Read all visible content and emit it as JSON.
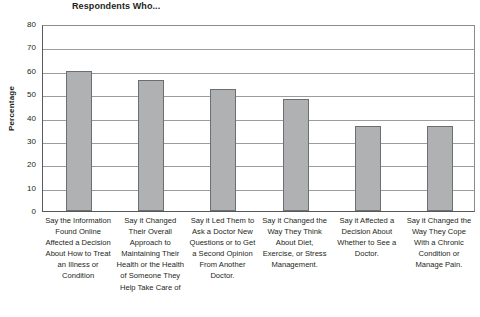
{
  "chart_data": {
    "type": "bar",
    "title": "Respondents Who...",
    "xlabel": "",
    "ylabel": "Percentage",
    "ylim": [
      0,
      80
    ],
    "yticks": [
      0,
      10,
      20,
      30,
      40,
      50,
      60,
      70,
      80
    ],
    "grid": "horizontal",
    "legend": "none",
    "bar_color": "#b0b1b3",
    "bar_border_color": "#6d6e70",
    "categories": [
      "Say the Information Found Online Affected a Decision About How to Treat an Illness or Condition",
      "Say it Changed Their Overall Approach to Maintaining Their Health or the Health of Someone They Help Take Care of",
      "Say it Led Them to Ask a Doctor New Questions or to Get a Second Opinion From Another Doctor.",
      "Say it Changed the Way They Think About Diet, Exercise, or Stress Management.",
      "Say it Affected a Decision About Whether to See a Doctor.",
      "Say it Changed the Way They Cope With a Chronic Condition or Manage Pain."
    ],
    "values": [
      60,
      56,
      52,
      48,
      36.5,
      36.5
    ]
  }
}
